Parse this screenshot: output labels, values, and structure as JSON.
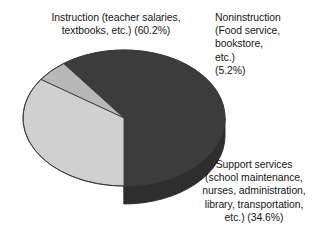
{
  "chart_data": {
    "type": "pie",
    "title": "",
    "three_d": true,
    "background": "#ffffff",
    "legend_position": "callout-labels",
    "categories": [
      "Instruction (teacher salaries, textbooks, etc.)",
      "Noninstruction (Food service, bookstore, etc.)",
      "Support services (school maintenance, nurses, administration, library, transportation, etc.)"
    ],
    "values": [
      60.2,
      5.2,
      34.6
    ],
    "units": "percent",
    "slices": [
      {
        "name": "Instruction",
        "percent": 60.2,
        "percent_text": "(60.2%)",
        "color": "#3c3c3c",
        "side_color": "#2e2e2e"
      },
      {
        "name": "Noninstruction",
        "percent": 5.2,
        "percent_text": "(5.2%)",
        "color": "#b8b8b8",
        "side_color": "#a3a3a3"
      },
      {
        "name": "Support services",
        "percent": 34.6,
        "percent_text": "(34.6%)",
        "color": "#d0d0d0",
        "side_color": "#bcbcbc"
      }
    ]
  },
  "labels": {
    "instruction": "Instruction (teacher salaries,\ntextbooks, etc.) (60.2%)",
    "noninstruction": "Noninstruction\n(Food service,\nbookstore,\netc.)\n(5.2%)",
    "support": "Support services\n(school maintenance,\nnurses, administration,\nlibrary, transportation,\netc.) (34.6%)"
  },
  "colors": {
    "instruction_fill": "#3c3c3c",
    "instruction_side": "#2e2e2e",
    "noninstruction_fill": "#b8b8b8",
    "noninstruction_side": "#a3a3a3",
    "support_fill": "#d0d0d0",
    "support_side": "#bcbcbc",
    "outline": "#3a3a3a",
    "background": "#ffffff",
    "text": "#161616"
  }
}
